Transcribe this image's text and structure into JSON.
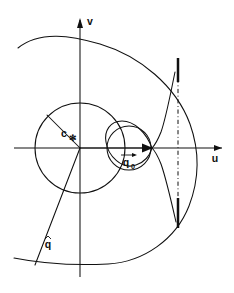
{
  "figure": {
    "background_color": "#ffffff",
    "line_color": "#101010",
    "width": 234,
    "height": 293
  },
  "axes": {
    "horizontal": {
      "name": "u-axis",
      "label": "u",
      "arrow": "right"
    },
    "vertical": {
      "name": "v-axis",
      "label": "v",
      "arrow": "up"
    },
    "origin": {
      "x": 80,
      "y": 148
    }
  },
  "labels": {
    "c_star": {
      "base": "c",
      "subscript": "✻"
    },
    "q_zero": {
      "base": "q",
      "subscript": "0",
      "accent": "vector-arrow"
    },
    "q_hat": {
      "base": "q",
      "accent": "hat"
    }
  },
  "elements": {
    "sonic_circle": {
      "name": "sonic-circle",
      "center_x": 80,
      "center_y": 148,
      "radius": 45
    },
    "small_circle": {
      "name": "small-circle",
      "center_x": 129,
      "center_y": 148,
      "radius": 22
    },
    "outer_arc": {
      "name": "limit-circle-arc",
      "center_x": 95,
      "center_y": 150,
      "radius": 107
    },
    "cardioid": {
      "name": "epicycloid-curve"
    },
    "sonic_line": {
      "name": "vertical-sonic-line",
      "x": 178,
      "style": "dash-dot"
    },
    "radius_c_star": {
      "name": "c-star-radius",
      "from": [
        80,
        148
      ],
      "to": [
        47,
        115
      ]
    },
    "ray_q_hat": {
      "name": "q-hat-ray",
      "from": [
        80,
        148
      ],
      "to": [
        35,
        265
      ]
    },
    "velocity_arrow": {
      "name": "q0-velocity-arrow",
      "from": [
        80,
        148
      ],
      "to": [
        152,
        148
      ]
    }
  }
}
